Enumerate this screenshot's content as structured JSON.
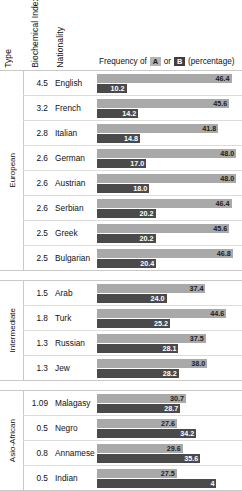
{
  "headers": {
    "type": "Type",
    "biochemical_index": "Biochemical Index",
    "nationality": "Nationality",
    "frequency_prefix": "Frequency of",
    "badge_a": "A",
    "conjunction": "or",
    "badge_b": "B",
    "frequency_suffix": "(percentage)"
  },
  "colors": {
    "bar_a": "#a9a9a9",
    "bar_b": "#4a4a4a",
    "badge_a_bg": "#b4b4b4",
    "badge_b_bg": "#3f3f3f",
    "rule": "#c9c9c9",
    "background": "#ffffff"
  },
  "chart_data": {
    "type": "bar",
    "title": "Frequency of A or B (percentage)",
    "orientation": "horizontal",
    "grouping": "paired",
    "xlabel": "percentage",
    "ylabel": "Nationality",
    "xlim": [
      0,
      50
    ],
    "grid": false,
    "legend": [
      "A",
      "B"
    ],
    "legend_position": "header",
    "series": [
      {
        "name": "A",
        "color": "#a9a9a9"
      },
      {
        "name": "B",
        "color": "#4a4a4a"
      }
    ],
    "groups": [
      {
        "type": "European",
        "rows": [
          {
            "index": "4.5",
            "nationality": "English",
            "a": 46.4,
            "b": 10.2
          },
          {
            "index": "3.2",
            "nationality": "French",
            "a": 45.6,
            "b": 14.2
          },
          {
            "index": "2.8",
            "nationality": "Italian",
            "a": 41.8,
            "b": 14.8
          },
          {
            "index": "2.6",
            "nationality": "German",
            "a": 48.0,
            "b": 17.0
          },
          {
            "index": "2.6",
            "nationality": "Austrian",
            "a": 48.0,
            "b": 18.0
          },
          {
            "index": "2.6",
            "nationality": "Serbian",
            "a": 46.4,
            "b": 20.2
          },
          {
            "index": "2.5",
            "nationality": "Greek",
            "a": 45.6,
            "b": 20.2
          },
          {
            "index": "2.5",
            "nationality": "Bulgarian",
            "a": 46.8,
            "b": 20.4
          }
        ]
      },
      {
        "type": "Intermediate",
        "rows": [
          {
            "index": "1.5",
            "nationality": "Arab",
            "a": 37.4,
            "b": 24.0
          },
          {
            "index": "1.8",
            "nationality": "Turk",
            "a": 44.6,
            "b": 25.2
          },
          {
            "index": "1.3",
            "nationality": "Russian",
            "a": 37.5,
            "b": 28.1
          },
          {
            "index": "1.3",
            "nationality": "Jew",
            "a": 38.0,
            "b": 28.2
          }
        ]
      },
      {
        "type": "Asio-African",
        "rows": [
          {
            "index": "1.09",
            "nationality": "Malagasy",
            "a": 30.7,
            "b": 28.7
          },
          {
            "index": "0.5",
            "nationality": "Negro",
            "a": 27.6,
            "b": 34.2
          },
          {
            "index": "0.8",
            "nationality": "Annamese",
            "a": 29.6,
            "b": 35.6
          },
          {
            "index": "0.5",
            "nationality": "Indian",
            "a": 27.5,
            "b": 41.2,
            "b_label_truncated": "4"
          }
        ]
      }
    ]
  }
}
